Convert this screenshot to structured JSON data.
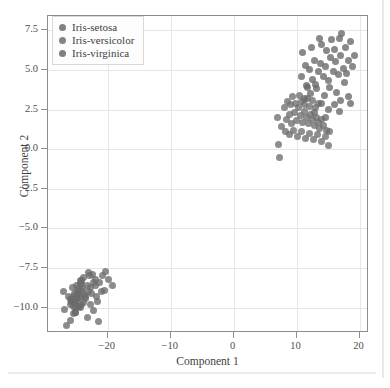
{
  "figure": {
    "background": "#ffffff",
    "frame_color": "#8d8d8d",
    "grid_color": "#e6e6e6"
  },
  "legend": {
    "position": "upper-left",
    "entries": [
      {
        "label": "Iris-setosa",
        "color": "#6b6b6b"
      },
      {
        "label": "Iris-versicolor",
        "color": "#6e6e6e"
      },
      {
        "label": "Iris-virginica",
        "color": "#686868"
      }
    ]
  },
  "chart_data": {
    "type": "scatter",
    "title": "",
    "xlabel": "Component 1",
    "ylabel": "Component 2",
    "xlim": [
      -29.5,
      21.5
    ],
    "ylim": [
      -11.6,
      8.4
    ],
    "xticks": [
      -20,
      -10,
      0,
      10,
      20
    ],
    "xticklabels": [
      "−20",
      "−10",
      "0",
      "10",
      "20"
    ],
    "yticks": [
      -10.0,
      -7.5,
      -5.0,
      -2.5,
      0.0,
      2.5,
      5.0,
      7.5
    ],
    "yticklabels": [
      "−10.0",
      "−7.5",
      "−5.0",
      "−2.5",
      "0.0",
      "2.5",
      "5.0",
      "7.5"
    ],
    "grid": true,
    "legend_position": "upper left",
    "marker_size": 7,
    "marker_opacity": 0.78,
    "series": [
      {
        "name": "Iris-setosa",
        "color": "#6b6b6b",
        "points": [
          [
            -25.9,
            -9.5
          ],
          [
            -24.8,
            -9.1
          ],
          [
            -25.4,
            -9.9
          ],
          [
            -25.1,
            -10.3
          ],
          [
            -26.2,
            -9.3
          ],
          [
            -24.3,
            -8.5
          ],
          [
            -25.6,
            -9.7
          ],
          [
            -25.0,
            -9.4
          ],
          [
            -25.9,
            -10.8
          ],
          [
            -24.7,
            -9.9
          ],
          [
            -24.9,
            -8.6
          ],
          [
            -25.2,
            -9.6
          ],
          [
            -25.4,
            -10.4
          ],
          [
            -26.9,
            -10.1
          ],
          [
            -23.9,
            -8.1
          ],
          [
            -22.9,
            -8.0
          ],
          [
            -24.1,
            -8.5
          ],
          [
            -25.7,
            -9.4
          ],
          [
            -23.2,
            -8.6
          ],
          [
            -24.6,
            -8.8
          ],
          [
            -23.5,
            -9.3
          ],
          [
            -24.8,
            -9.0
          ],
          [
            -27.0,
            -9.0
          ],
          [
            -23.8,
            -9.7
          ],
          [
            -24.2,
            -9.8
          ],
          [
            -24.3,
            -9.3
          ],
          [
            -24.6,
            -9.4
          ],
          [
            -25.5,
            -9.3
          ],
          [
            -25.8,
            -9.6
          ],
          [
            -24.5,
            -9.9
          ],
          [
            -24.4,
            -10.0
          ],
          [
            -23.7,
            -9.2
          ],
          [
            -24.1,
            -8.3
          ],
          [
            -24.4,
            -8.3
          ],
          [
            -24.7,
            -9.9
          ],
          [
            -25.9,
            -9.8
          ],
          [
            -25.6,
            -8.7
          ],
          [
            -25.8,
            -9.5
          ],
          [
            -25.2,
            -10.3
          ],
          [
            -24.9,
            -9.4
          ],
          [
            -25.3,
            -9.1
          ],
          [
            -26.5,
            -11.1
          ],
          [
            -25.1,
            -10.0
          ],
          [
            -23.6,
            -9.4
          ],
          [
            -22.8,
            -8.7
          ],
          [
            -24.6,
            -9.2
          ],
          [
            -24.0,
            -8.8
          ],
          [
            -25.3,
            -9.7
          ],
          [
            -24.2,
            -8.9
          ],
          [
            -25.0,
            -9.5
          ],
          [
            -21.9,
            -8.6
          ],
          [
            -22.4,
            -7.9
          ],
          [
            -23.1,
            -7.8
          ],
          [
            -22.0,
            -8.2
          ],
          [
            -20.9,
            -8.0
          ],
          [
            -21.3,
            -8.4
          ],
          [
            -20.3,
            -7.7
          ],
          [
            -22.6,
            -9.1
          ],
          [
            -21.6,
            -9.6
          ],
          [
            -22.2,
            -10.2
          ],
          [
            -21.0,
            -9.0
          ],
          [
            -21.8,
            -9.3
          ],
          [
            -23.3,
            -10.6
          ],
          [
            -22.7,
            -9.8
          ],
          [
            -19.9,
            -8.2
          ],
          [
            -20.6,
            -8.9
          ],
          [
            -21.4,
            -10.9
          ],
          [
            -19.2,
            -8.6
          ],
          [
            -23.0,
            -9.0
          ],
          [
            -22.3,
            -8.4
          ]
        ]
      },
      {
        "name": "Iris-versicolor",
        "color": "#6e6e6e",
        "points": [
          [
            7.0,
            2.0
          ],
          [
            7.2,
            0.3
          ],
          [
            7.3,
            -0.5
          ],
          [
            8.4,
            1.9
          ],
          [
            8.8,
            2.2
          ],
          [
            9.2,
            1.6
          ],
          [
            9.6,
            2.3
          ],
          [
            10.0,
            1.8
          ],
          [
            10.3,
            2.6
          ],
          [
            10.6,
            2.1
          ],
          [
            10.9,
            1.7
          ],
          [
            11.2,
            2.4
          ],
          [
            11.6,
            2.0
          ],
          [
            11.9,
            1.6
          ],
          [
            12.2,
            2.2
          ],
          [
            12.5,
            1.9
          ],
          [
            12.8,
            1.5
          ],
          [
            13.1,
            2.0
          ],
          [
            13.4,
            1.7
          ],
          [
            13.7,
            1.3
          ],
          [
            14.0,
            1.9
          ],
          [
            14.3,
            1.5
          ],
          [
            14.7,
            1.2
          ],
          [
            8.0,
            2.6
          ],
          [
            8.6,
            3.0
          ],
          [
            9.0,
            2.8
          ],
          [
            9.4,
            3.3
          ],
          [
            9.9,
            2.9
          ],
          [
            10.4,
            3.4
          ],
          [
            10.8,
            3.0
          ],
          [
            11.3,
            2.8
          ],
          [
            11.7,
            3.2
          ],
          [
            12.1,
            2.7
          ],
          [
            12.6,
            3.1
          ],
          [
            13.0,
            2.6
          ],
          [
            13.5,
            2.9
          ],
          [
            7.6,
            1.4
          ],
          [
            8.2,
            1.1
          ],
          [
            8.9,
            0.9
          ],
          [
            9.5,
            1.2
          ],
          [
            10.1,
            0.8
          ],
          [
            10.7,
            1.1
          ],
          [
            11.4,
            0.7
          ],
          [
            12.0,
            1.0
          ],
          [
            12.7,
            0.6
          ],
          [
            13.3,
            0.9
          ],
          [
            14.0,
            0.5
          ],
          [
            14.6,
            0.8
          ],
          [
            15.2,
            1.1
          ],
          [
            15.0,
            0.2
          ]
        ]
      },
      {
        "name": "Iris-virginica",
        "color": "#686868",
        "points": [
          [
            10.8,
            4.6
          ],
          [
            11.4,
            5.3
          ],
          [
            11.0,
            6.1
          ],
          [
            12.0,
            5.0
          ],
          [
            12.6,
            4.4
          ],
          [
            11.8,
            3.9
          ],
          [
            12.9,
            5.6
          ],
          [
            13.4,
            4.9
          ],
          [
            13.0,
            4.1
          ],
          [
            13.8,
            5.4
          ],
          [
            14.2,
            4.6
          ],
          [
            14.6,
            5.2
          ],
          [
            15.0,
            4.3
          ],
          [
            15.4,
            5.8
          ],
          [
            15.8,
            4.9
          ],
          [
            16.2,
            5.5
          ],
          [
            16.6,
            4.7
          ],
          [
            17.0,
            5.9
          ],
          [
            17.4,
            5.1
          ],
          [
            17.8,
            6.4
          ],
          [
            18.2,
            5.6
          ],
          [
            18.6,
            6.8
          ],
          [
            16.0,
            6.3
          ],
          [
            16.8,
            7.0
          ],
          [
            17.2,
            7.3
          ],
          [
            15.6,
            6.9
          ],
          [
            14.8,
            6.2
          ],
          [
            14.0,
            6.6
          ],
          [
            13.6,
            7.0
          ],
          [
            12.4,
            6.4
          ],
          [
            11.6,
            4.0
          ],
          [
            12.2,
            3.5
          ],
          [
            13.2,
            3.8
          ],
          [
            14.4,
            3.4
          ],
          [
            15.2,
            3.9
          ],
          [
            16.4,
            3.6
          ],
          [
            17.6,
            4.2
          ],
          [
            18.0,
            4.8
          ],
          [
            18.8,
            5.2
          ],
          [
            19.2,
            5.9
          ],
          [
            13.9,
            2.9
          ],
          [
            15.0,
            2.5
          ],
          [
            16.0,
            2.8
          ],
          [
            17.0,
            3.1
          ],
          [
            18.2,
            3.3
          ],
          [
            12.8,
            2.3
          ],
          [
            14.6,
            2.0
          ],
          [
            16.8,
            2.4
          ],
          [
            18.6,
            2.9
          ],
          [
            11.2,
            3.2
          ]
        ]
      }
    ]
  }
}
